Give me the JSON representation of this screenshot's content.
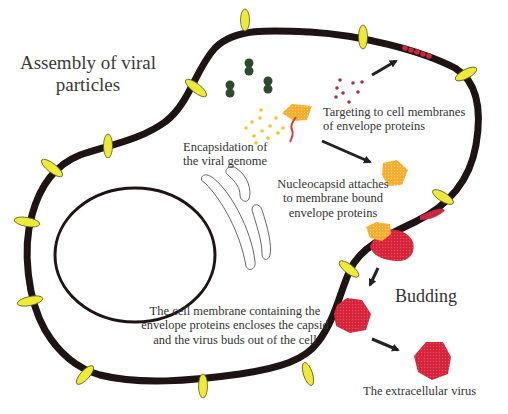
{
  "title": "Assembly of viral\nparticles",
  "labels": {
    "encapsidation": "Encapsidation of\nthe viral genome",
    "targeting": "Targeting to cell membranes\nof envelope proteins",
    "nucleocapsid": "Nucleocapsid attaches\nto membrane bound\nenvelope proteins",
    "enclosing": "The cell membrane containing the\nenvelope proteins encloses the capsid\nand the virus buds out of the cell",
    "budding": "Budding",
    "extracellular": "The extracellular virus"
  },
  "colors": {
    "membrane": "#1e1414",
    "membrane_protein": "#eeea3c",
    "envelope_protein": "#c8283c",
    "capsid": "#f5ad2e",
    "virion": "#d4233a",
    "ribosome": "#2c4a2c",
    "genome_rna": "#d23c3c",
    "golgi": "#666666",
    "arrow": "#222222"
  },
  "stages": [
    "Encapsidation of the viral genome",
    "Targeting to cell membranes of envelope proteins",
    "Nucleocapsid attaches to membrane bound envelope proteins",
    "The cell membrane containing the envelope proteins encloses the capsid and the virus buds out of the cell",
    "Budding",
    "The extracellular virus"
  ]
}
